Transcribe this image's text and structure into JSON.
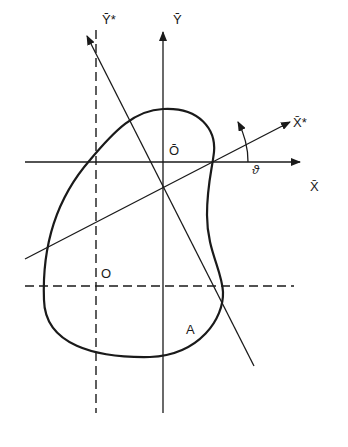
{
  "figure": {
    "labels": {
      "y_bar_star": "Ȳ*",
      "y_bar": "Ȳ",
      "x_bar_star": "X̄*",
      "x_bar": "X̄",
      "centroid": "Ō",
      "theta": "ϑ",
      "origin": "O",
      "area": "A"
    },
    "colors": {
      "ink": "#1a1a1a",
      "background": "#ffffff"
    }
  }
}
